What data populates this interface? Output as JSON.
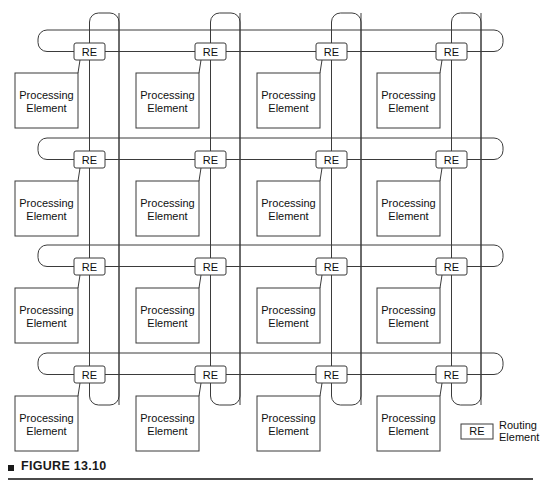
{
  "figure": {
    "caption_marker": "■",
    "caption": "FIGURE 13.10"
  },
  "diagram": {
    "type": "torus-interconnection-network",
    "rows": 4,
    "columns": 4,
    "node_count": 16,
    "pe_label_line1": "Processing",
    "pe_label_line2": "Element",
    "re_label": "RE",
    "colors": {
      "line": "#3b3b3b",
      "box_fill": "#ffffff",
      "text": "#101010",
      "caption": "#1a1a1a"
    },
    "nodes": [
      {
        "row": 0,
        "col": 0,
        "re": "RE",
        "pe_line1": "Processing",
        "pe_line2": "Element"
      },
      {
        "row": 0,
        "col": 1,
        "re": "RE",
        "pe_line1": "Processing",
        "pe_line2": "Element"
      },
      {
        "row": 0,
        "col": 2,
        "re": "RE",
        "pe_line1": "Processing",
        "pe_line2": "Element"
      },
      {
        "row": 0,
        "col": 3,
        "re": "RE",
        "pe_line1": "Processing",
        "pe_line2": "Element"
      },
      {
        "row": 1,
        "col": 0,
        "re": "RE",
        "pe_line1": "Processing",
        "pe_line2": "Element"
      },
      {
        "row": 1,
        "col": 1,
        "re": "RE",
        "pe_line1": "Processing",
        "pe_line2": "Element"
      },
      {
        "row": 1,
        "col": 2,
        "re": "RE",
        "pe_line1": "Processing",
        "pe_line2": "Element"
      },
      {
        "row": 1,
        "col": 3,
        "re": "RE",
        "pe_line1": "Processing",
        "pe_line2": "Element"
      },
      {
        "row": 2,
        "col": 0,
        "re": "RE",
        "pe_line1": "Processing",
        "pe_line2": "Element"
      },
      {
        "row": 2,
        "col": 1,
        "re": "RE",
        "pe_line1": "Processing",
        "pe_line2": "Element"
      },
      {
        "row": 2,
        "col": 2,
        "re": "RE",
        "pe_line1": "Processing",
        "pe_line2": "Element"
      },
      {
        "row": 2,
        "col": 3,
        "re": "RE",
        "pe_line1": "Processing",
        "pe_line2": "Element"
      },
      {
        "row": 3,
        "col": 0,
        "re": "RE",
        "pe_line1": "Processing",
        "pe_line2": "Element"
      },
      {
        "row": 3,
        "col": 1,
        "re": "RE",
        "pe_line1": "Processing",
        "pe_line2": "Element"
      },
      {
        "row": 3,
        "col": 2,
        "re": "RE",
        "pe_line1": "Processing",
        "pe_line2": "Element"
      },
      {
        "row": 3,
        "col": 3,
        "re": "RE",
        "pe_line1": "Processing",
        "pe_line2": "Element"
      }
    ]
  },
  "legend": {
    "symbol": "RE",
    "label_line1": "Routing",
    "label_line2": "Element"
  }
}
